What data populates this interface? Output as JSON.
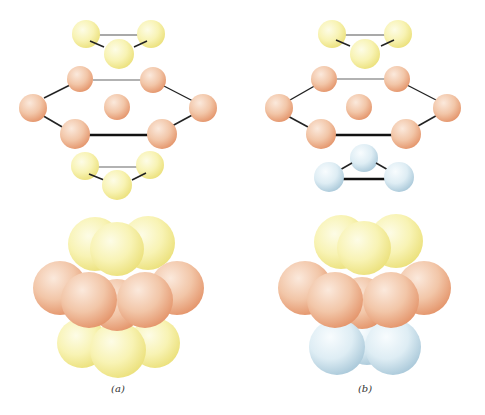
{
  "figure": {
    "panels": [
      {
        "id": "a",
        "caption": "(a)",
        "layers": {
          "top": {
            "color": "yellow",
            "shape": "triangle"
          },
          "middle": {
            "color": "orange",
            "shape": "centered-hexagon"
          },
          "bottom": {
            "color": "yellow",
            "shape": "triangle",
            "orientation": "same-as-top"
          }
        }
      },
      {
        "id": "b",
        "caption": "(b)",
        "layers": {
          "top": {
            "color": "yellow",
            "shape": "triangle"
          },
          "middle": {
            "color": "orange",
            "shape": "centered-hexagon"
          },
          "bottom": {
            "color": "blue",
            "shape": "triangle",
            "orientation": "rotated"
          }
        }
      }
    ],
    "colors": {
      "yellow": "#f7f2a8",
      "yellow_shade": "#eee37a",
      "orange": "#f2c4a4",
      "orange_shade": "#e69a72",
      "blue": "#dcecf3",
      "blue_shade": "#a8c8d8",
      "bond": "#222222",
      "background": "#ffffff"
    }
  }
}
